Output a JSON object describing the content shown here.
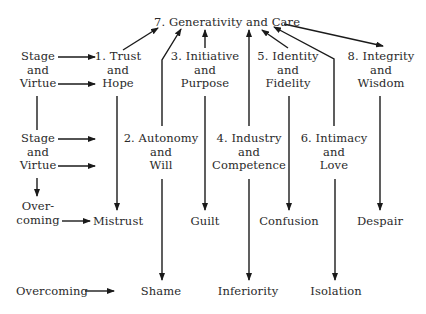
{
  "diagram": {
    "top": {
      "label": "7. Generativity and Care"
    },
    "left_column": {
      "block1": [
        "Stage",
        "and",
        "Virtue"
      ],
      "block2": [
        "Stage",
        "and",
        "Virtue"
      ],
      "overcoming_split": [
        "Over-",
        "coming"
      ],
      "overcoming": "Overcoming"
    },
    "stages": [
      {
        "id": 1,
        "lines": [
          "1. Trust",
          "and",
          "Hope"
        ],
        "crisis": "Mistrust"
      },
      {
        "id": 2,
        "lines": [
          "2. Autonomy",
          "and",
          "Will"
        ],
        "crisis": "Shame"
      },
      {
        "id": 3,
        "lines": [
          "3. Initiative",
          "and",
          "Purpose"
        ],
        "crisis": "Guilt"
      },
      {
        "id": 4,
        "lines": [
          "4. Industry",
          "and",
          "Competence"
        ],
        "crisis": "Inferiority"
      },
      {
        "id": 5,
        "lines": [
          "5. Identity",
          "and",
          "Fidelity"
        ],
        "crisis": "Confusion"
      },
      {
        "id": 6,
        "lines": [
          "6. Intimacy",
          "and",
          "Love"
        ],
        "crisis": "Isolation"
      },
      {
        "id": 8,
        "lines": [
          "8. Integrity",
          "and",
          "Wisdom"
        ],
        "crisis": "Despair"
      }
    ],
    "line_color": "#1a1a1a",
    "text_color": "#2a2a2a"
  }
}
